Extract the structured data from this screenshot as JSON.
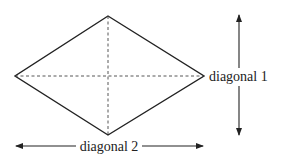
{
  "diagram": {
    "shape": "rhombus",
    "labels": {
      "diagonal1": "diagonal 1",
      "diagonal2": "diagonal 2"
    },
    "colors": {
      "stroke": "#222222",
      "background": "#ffffff"
    }
  }
}
